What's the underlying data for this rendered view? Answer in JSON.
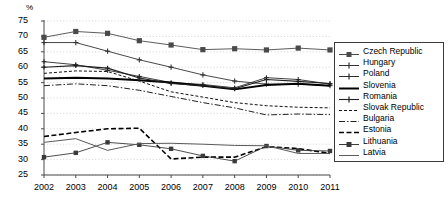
{
  "chart_data": {
    "type": "line",
    "title": "",
    "subtitle": "",
    "xlabel": "",
    "ylabel": "%",
    "unit_label": "%",
    "grid": true,
    "legend_position": "right",
    "categories": [
      "2002",
      "2003",
      "2004",
      "2005",
      "2006",
      "2007",
      "2008",
      "2009",
      "2010",
      "2011"
    ],
    "x": [
      2002,
      2003,
      2004,
      2005,
      2006,
      2007,
      2008,
      2009,
      2010,
      2011
    ],
    "xlim": [
      2002,
      2011
    ],
    "ylim": [
      25,
      75
    ],
    "yticks": [
      25,
      30,
      35,
      40,
      45,
      50,
      55,
      60,
      65,
      70,
      75
    ],
    "xticks": [
      "2002",
      "2003",
      "2004",
      "2005",
      "2006",
      "2007",
      "2008",
      "2009",
      "2010",
      "2011"
    ],
    "series": [
      {
        "name": "Czech Republic",
        "style": "solid-square",
        "color": "#4a4a4a",
        "values": [
          69.7,
          71.6,
          71.0,
          68.6,
          67.2,
          65.7,
          66.0,
          65.6,
          66.2,
          65.6
        ]
      },
      {
        "name": "Hungary",
        "style": "solid-plus",
        "color": "#333333",
        "values": [
          68.0,
          68.0,
          65.2,
          62.4,
          60.0,
          57.5,
          55.5,
          54.5,
          54.5,
          54.0
        ]
      },
      {
        "name": "Poland",
        "style": "solid-plus-thin",
        "color": "#2b2b2b",
        "values": [
          61.8,
          60.8,
          59.0,
          57.0,
          55.0,
          54.4,
          53.3,
          56.6,
          56.0,
          54.5
        ]
      },
      {
        "name": "Slovenia",
        "style": "solid-thick",
        "color": "#000000",
        "values": [
          56.3,
          56.6,
          56.3,
          55.8,
          55.0,
          54.0,
          52.8,
          54.2,
          54.6,
          54.0
        ]
      },
      {
        "name": "Romania",
        "style": "solid-plus-mid",
        "color": "#1f1f1f",
        "values": [
          60.0,
          60.5,
          59.7,
          56.5,
          54.7,
          54.0,
          53.0,
          56.0,
          55.4,
          54.7
        ]
      },
      {
        "name": "Slovak Republic",
        "style": "dashed-fine",
        "color": "#111111",
        "values": [
          58.0,
          58.8,
          58.6,
          55.5,
          52.0,
          50.3,
          48.5,
          47.5,
          47.0,
          46.8
        ]
      },
      {
        "name": "Bulgaria",
        "style": "dash-dot",
        "color": "#222222",
        "values": [
          54.0,
          54.6,
          54.0,
          52.5,
          50.5,
          48.5,
          46.8,
          44.5,
          44.8,
          44.6
        ]
      },
      {
        "name": "Estonia",
        "style": "dashed-bold",
        "color": "#000000",
        "values": [
          37.5,
          38.8,
          40.0,
          40.2,
          30.2,
          30.8,
          30.8,
          34.2,
          33.6,
          32.0
        ]
      },
      {
        "name": "Lithuania",
        "style": "solid-square-thin",
        "color": "#3a3a3a",
        "values": [
          30.8,
          32.2,
          35.6,
          34.8,
          33.5,
          31.2,
          29.5,
          34.4,
          33.0,
          32.8
        ]
      },
      {
        "name": "Latvia",
        "style": "solid-grey",
        "color": "#5a5a5a",
        "values": [
          35.6,
          36.8,
          33.0,
          35.2,
          35.3,
          35.0,
          34.6,
          34.5,
          32.0,
          32.0
        ]
      }
    ]
  },
  "axis": {
    "unit": "%",
    "ytick_labels": [
      "75",
      "70",
      "65",
      "60",
      "55",
      "50",
      "45",
      "40",
      "35",
      "30",
      "25"
    ],
    "xtick_labels": [
      "2002",
      "2003",
      "2004",
      "2005",
      "2006",
      "2007",
      "2008",
      "2009",
      "2010",
      "2011"
    ]
  },
  "legend": {
    "items": [
      {
        "label": "Czech Republic"
      },
      {
        "label": "Hungary"
      },
      {
        "label": "Poland"
      },
      {
        "label": "Slovenia"
      },
      {
        "label": "Romania"
      },
      {
        "label": "Slovak Republic"
      },
      {
        "label": "Bulgaria"
      },
      {
        "label": "Estonia"
      },
      {
        "label": "Lithuania"
      },
      {
        "label": "Latvia"
      }
    ]
  }
}
